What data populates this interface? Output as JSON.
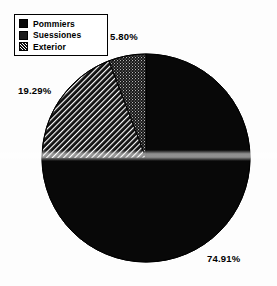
{
  "chart_data": {
    "type": "pie",
    "title": "",
    "categories": [
      "Pommiers",
      "Suessiones",
      "Exterior"
    ],
    "values": [
      74.91,
      19.29,
      5.8
    ],
    "value_labels": [
      "74.91%",
      "19.29%",
      "5.80%"
    ],
    "units": "percent",
    "start_angle_deg": 0,
    "direction": "clockwise",
    "legend_position": "top-left",
    "grid": false,
    "series": [
      {
        "name": "Pommiers",
        "value": 74.91,
        "label": "74.91%",
        "fill": "solid-black",
        "color": "#080808"
      },
      {
        "name": "Suessiones",
        "value": 19.29,
        "label": "19.29%",
        "fill": "diagonal-hatch",
        "color": "#141414"
      },
      {
        "name": "Exterior",
        "value": 5.8,
        "label": "5.80%",
        "fill": "stipple-dots",
        "color": "#1c1c1c"
      }
    ]
  },
  "legend": {
    "items": [
      {
        "label": "Pommiers",
        "swatch": "solid-black-swatch"
      },
      {
        "label": "Suessiones",
        "swatch": "stipple-swatch"
      },
      {
        "label": "Exterior",
        "swatch": "hatch-swatch"
      }
    ]
  },
  "callouts": {
    "exterior": "5.80%",
    "suessiones": "19.29%",
    "pommiers": "74.91%"
  },
  "colors": {
    "background": "#ffffff",
    "ink": "#000000",
    "slice_pommiers": "#080808",
    "slice_suessiones": "#141414",
    "slice_exterior": "#1c1c1c"
  }
}
